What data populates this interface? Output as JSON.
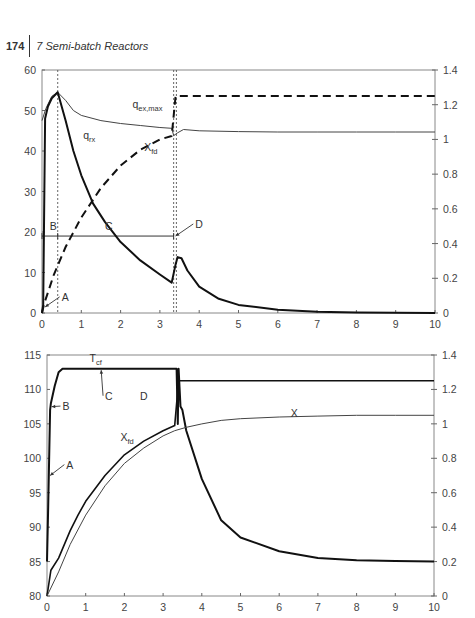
{
  "header": {
    "page_number": "174",
    "running_title": "7  Semi-batch Reactors"
  },
  "chart_data": [
    {
      "type": "line",
      "title": "",
      "xlabel": "",
      "ylabel": "",
      "xlim": [
        0,
        10
      ],
      "ylim": [
        0,
        60
      ],
      "y2lim": [
        0,
        1.4
      ],
      "grid": false,
      "x_ticks": [
        "0",
        "1",
        "2",
        "3",
        "4",
        "5",
        "6",
        "7",
        "8",
        "9",
        "10"
      ],
      "y_ticks_left": [
        "0",
        "10",
        "20",
        "30",
        "40",
        "50",
        "60"
      ],
      "y_ticks_right": [
        "0",
        "0.2",
        "0.4",
        "0.6",
        "0.8",
        "1",
        "1.2",
        "1.4"
      ],
      "series": [
        {
          "name": "q_ex,max",
          "axis": "left",
          "style": "thin solid",
          "x": [
            0,
            0.1,
            0.25,
            0.4,
            0.6,
            0.8,
            1.0,
            1.5,
            2.0,
            2.5,
            3.0,
            3.3,
            3.35,
            3.45,
            3.6,
            4.0,
            5,
            6,
            7,
            8,
            9,
            10
          ],
          "y": [
            47.5,
            50.5,
            53.5,
            54.5,
            52.5,
            50,
            48.8,
            47.5,
            46.8,
            46.3,
            45.8,
            45.6,
            43.8,
            44.5,
            45.3,
            45,
            44.8,
            44.7,
            44.7,
            44.7,
            44.7,
            44.7
          ]
        },
        {
          "name": "q_rx",
          "axis": "left",
          "style": "thick solid",
          "x": [
            0,
            0.03,
            0.08,
            0.15,
            0.25,
            0.4,
            0.6,
            0.8,
            1.0,
            1.3,
            1.6,
            2.0,
            2.5,
            3.0,
            3.3,
            3.4,
            3.45,
            3.55,
            3.7,
            4.0,
            4.5,
            5,
            6,
            7,
            8,
            10
          ],
          "y": [
            0,
            2,
            48,
            51,
            53,
            54.5,
            47.5,
            40,
            34,
            27,
            22.5,
            17.5,
            13,
            9.5,
            7.5,
            12,
            13.8,
            13.5,
            10.5,
            6.5,
            3.5,
            2,
            0.8,
            0.3,
            0.15,
            0
          ]
        },
        {
          "name": "X_fd",
          "axis": "right",
          "style": "thick dashed",
          "x": [
            0,
            0.05,
            0.3,
            0.6,
            1.0,
            1.5,
            2.0,
            2.5,
            3.0,
            3.3,
            3.4,
            3.45,
            10
          ],
          "y": [
            0,
            0.05,
            0.22,
            0.38,
            0.55,
            0.72,
            0.85,
            0.94,
            1.0,
            1.02,
            1.25,
            1.25,
            1.25
          ]
        }
      ],
      "reference_lines": [
        {
          "type": "vertical dotted",
          "x": 0.4
        },
        {
          "type": "vertical dotted",
          "x": 3.35
        },
        {
          "type": "vertical dotted",
          "x": 3.42
        }
      ],
      "annotations": [
        {
          "text": "q_ex,max",
          "x": 2.3,
          "y": 50.5
        },
        {
          "text": "q_rx",
          "x": 1.05,
          "y": 43
        },
        {
          "text": "X_fd",
          "x": 2.6,
          "y": 40
        },
        {
          "text": "A",
          "x": 0.5,
          "y": 3,
          "arrow_to": [
            0.08,
            1.5
          ]
        },
        {
          "text": "B",
          "x": 0.2,
          "y": 20.5
        },
        {
          "text": "C",
          "x": 1.6,
          "y": 20.5
        },
        {
          "text": "D",
          "x": 3.9,
          "y": 21,
          "arrow_to": [
            3.4,
            19
          ]
        }
      ],
      "phase_bar": {
        "y": 19,
        "x_start": 0,
        "x_mid": 0.4,
        "x_end": 3.35
      }
    },
    {
      "type": "line",
      "title": "",
      "xlabel": "",
      "ylabel": "",
      "xlim": [
        0,
        10
      ],
      "ylim": [
        80,
        115
      ],
      "y2lim": [
        0,
        1.4
      ],
      "grid": false,
      "x_ticks": [
        "0",
        "1",
        "2",
        "3",
        "4",
        "5",
        "6",
        "7",
        "8",
        "9",
        "10"
      ],
      "y_ticks_left": [
        "80",
        "85",
        "90",
        "95",
        "100",
        "105",
        "110",
        "115"
      ],
      "y_ticks_right": [
        "0",
        "0.2",
        "0.4",
        "0.6",
        "0.8",
        "1",
        "1.2",
        "1.4"
      ],
      "series": [
        {
          "name": "T_cf",
          "axis": "left",
          "style": "thick solid",
          "x": [
            0,
            0.03,
            0.08,
            0.1,
            0.2,
            0.3,
            0.4,
            3.35,
            3.38,
            3.4,
            3.45,
            3.5,
            3.6,
            4.0,
            4.5,
            5,
            6,
            7,
            8,
            9,
            10
          ],
          "y": [
            85,
            93,
            107,
            108,
            110.5,
            112.5,
            113,
            113,
            105,
            113,
            107.5,
            107,
            104,
            97,
            91,
            88.5,
            86.5,
            85.5,
            85.2,
            85.1,
            85
          ]
        },
        {
          "name": "X_fd",
          "axis": "right",
          "style": "medium solid",
          "x": [
            0,
            0.1,
            0.3,
            0.6,
            0.8,
            1.0,
            1.5,
            2.0,
            2.5,
            3.0,
            3.3,
            3.4,
            3.45,
            10
          ],
          "y": [
            0,
            0.15,
            0.22,
            0.38,
            0.47,
            0.55,
            0.7,
            0.82,
            0.9,
            0.96,
            0.99,
            1.25,
            1.25,
            1.25
          ]
        },
        {
          "name": "X",
          "axis": "right",
          "style": "thin solid",
          "x": [
            0,
            0.3,
            0.6,
            1.0,
            1.5,
            2.0,
            2.5,
            3.0,
            3.3,
            3.6,
            4.0,
            4.5,
            5,
            6,
            7,
            8,
            9,
            10
          ],
          "y": [
            0,
            0.14,
            0.3,
            0.47,
            0.64,
            0.77,
            0.86,
            0.93,
            0.96,
            0.98,
            1.0,
            1.02,
            1.03,
            1.04,
            1.045,
            1.05,
            1.05,
            1.05
          ]
        }
      ],
      "annotations": [
        {
          "text": "T_cf",
          "x": 1.1,
          "y": 114
        },
        {
          "text": "A",
          "x": 0.5,
          "y": 98.5,
          "arrow_to": [
            0.08,
            97.5
          ]
        },
        {
          "text": "B",
          "x": 0.4,
          "y": 107,
          "arrow_to": [
            0.12,
            107.5
          ]
        },
        {
          "text": "C",
          "x": 1.5,
          "y": 108.5,
          "arrow_to": [
            1.4,
            112.8
          ]
        },
        {
          "text": "D",
          "x": 2.4,
          "y": 108.5
        },
        {
          "text": "X_fd",
          "x": 1.9,
          "y": 102.5
        },
        {
          "text": "X",
          "x": 6.3,
          "y": 106
        }
      ]
    }
  ]
}
